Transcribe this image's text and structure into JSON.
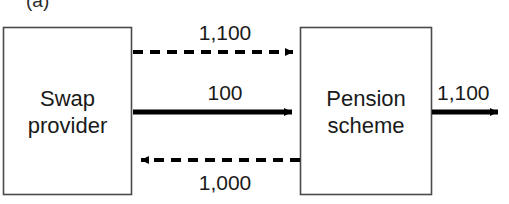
{
  "figure": {
    "panel_label": "(a)",
    "background_color": "#ffffff",
    "stroke_color": "#000000",
    "text_color": "#1a1a1a"
  },
  "nodes": [
    {
      "id": "swap-provider",
      "label": "Swap\nprovider",
      "x": 3,
      "y": 27,
      "width": 129,
      "height": 168
    },
    {
      "id": "pension-scheme",
      "label": "Pension\nscheme",
      "x": 300,
      "y": 27,
      "width": 132,
      "height": 168
    }
  ],
  "edges": [
    {
      "id": "swap-to-pension-top",
      "label": "1,100",
      "style": "dashed",
      "direction": "right",
      "from": "swap-provider",
      "to": "pension-scheme",
      "y": 52
    },
    {
      "id": "swap-to-pension-middle",
      "label": "100",
      "style": "solid",
      "direction": "right",
      "from": "swap-provider",
      "to": "pension-scheme",
      "y": 112
    },
    {
      "id": "pension-to-swap-bottom",
      "label": "1,000",
      "style": "dashed",
      "direction": "left",
      "from": "pension-scheme",
      "to": "swap-provider",
      "y": 160
    },
    {
      "id": "pension-outflow",
      "label": "1,100",
      "style": "solid",
      "direction": "right",
      "from": "pension-scheme",
      "to": "",
      "y": 112
    }
  ]
}
